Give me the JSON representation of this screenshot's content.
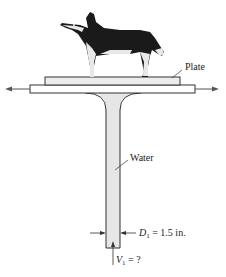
{
  "figure": {
    "labels": {
      "plate": "Plate",
      "water": "Water",
      "diameter_symbol": "D",
      "diameter_subscript": "1",
      "diameter_value": " = 1.5 in.",
      "velocity_symbol": "V",
      "velocity_subscript": "1",
      "velocity_value": " = ?"
    },
    "colors": {
      "line": "#333333",
      "plate_fill": "#ececec",
      "water_fill": "#e6e6e6",
      "dog_dark": "#1a1a1a",
      "dog_light": "#e8e8e8"
    }
  }
}
